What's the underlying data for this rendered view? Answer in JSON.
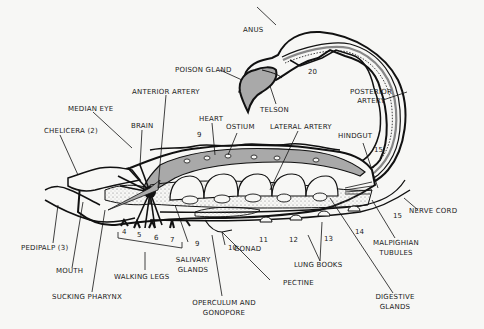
{
  "diagram": {
    "colors": {
      "background": "#f7f7f5",
      "outline": "#111111",
      "gray_fill": "#a9a9a9",
      "dots": "#8a8a8a"
    },
    "labels": {
      "anus": "ANUS",
      "poison_gland": "POISON GLAND",
      "telson": "TELSON",
      "anterior_artery": "ANTERIOR ARTERY",
      "posterior_artery_1": "POSTERIOR",
      "posterior_artery_2": "ARTERY",
      "median_eye": "MEDIAN EYE",
      "chelicera": "CHELICERA (2)",
      "brain": "BRAIN",
      "heart": "HEART",
      "ostium": "OSTIUM",
      "lateral_artery": "LATERAL ARTERY",
      "hindgut": "HINDGUT",
      "nerve_cord": "NERVE CORD",
      "malpighian_1": "MALPIGHIAN",
      "malpighian_2": "TUBULES",
      "digestive_1": "DIGESTIVE",
      "digestive_2": "GLANDS",
      "lung_books": "LUNG BOOKS",
      "pectine": "PECTINE",
      "gonad": "GONAD",
      "salivary_1": "SALIVARY",
      "salivary_2": "GLANDS",
      "operculum_1": "OPERCULUM AND",
      "operculum_2": "GONOPORE",
      "walking_legs": "WALKING LEGS",
      "sucking_pharynx": "SUCKING PHARYNX",
      "mouth": "MOUTH",
      "pedipalp": "PEDIPALP (3)"
    },
    "segment_numbers": {
      "n20": "20",
      "n9_top": "9",
      "n15_top": "15",
      "n15_bottom": "15",
      "n4": "4",
      "n5": "5",
      "n6": "6",
      "n7": "7",
      "n9_bottom": "9",
      "n10": "10",
      "n11": "11",
      "n12": "12",
      "n13": "13",
      "n14": "14"
    }
  }
}
